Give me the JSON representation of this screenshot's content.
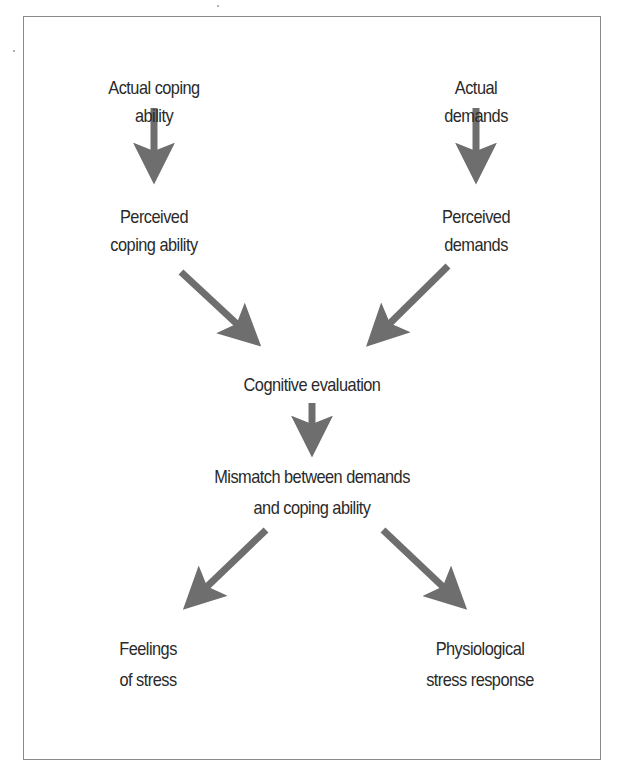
{
  "diagram": {
    "type": "flowchart",
    "colors": {
      "arrow": "#6e6e6e",
      "border": "#8a8a8a",
      "text": "#2a2a2a",
      "background": "#ffffff"
    },
    "nodes": {
      "actual_coping": {
        "line1": "Actual coping",
        "line2": "ability"
      },
      "actual_demands": {
        "line1": "Actual",
        "line2": "demands"
      },
      "perceived_coping": {
        "line1": "Perceived",
        "line2": "coping ability"
      },
      "perceived_demands": {
        "line1": "Perceived",
        "line2": "demands"
      },
      "cognitive_evaluation": {
        "line1": "Cognitive evaluation"
      },
      "mismatch": {
        "line1": "Mismatch between demands",
        "line2": "and coping ability"
      },
      "feelings_of_stress": {
        "line1": "Feelings",
        "line2": "of stress"
      },
      "physiological_response": {
        "line1": "Physiological",
        "line2": "stress response"
      }
    },
    "edges": [
      {
        "from": "actual_coping",
        "to": "perceived_coping"
      },
      {
        "from": "actual_demands",
        "to": "perceived_demands"
      },
      {
        "from": "perceived_coping",
        "to": "cognitive_evaluation"
      },
      {
        "from": "perceived_demands",
        "to": "cognitive_evaluation"
      },
      {
        "from": "cognitive_evaluation",
        "to": "mismatch"
      },
      {
        "from": "mismatch",
        "to": "feelings_of_stress"
      },
      {
        "from": "mismatch",
        "to": "physiological_response"
      }
    ]
  }
}
